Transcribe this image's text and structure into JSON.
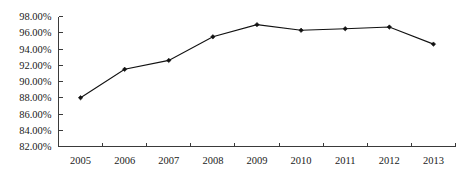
{
  "chart_data": {
    "type": "line",
    "title": "",
    "subtitle": "",
    "xlabel": "",
    "ylabel": "",
    "categories": [
      "2005",
      "2006",
      "2007",
      "2008",
      "2009",
      "2010",
      "2011",
      "2012",
      "2013"
    ],
    "values": [
      88.0,
      91.5,
      92.6,
      95.5,
      97.0,
      96.3,
      96.5,
      96.7,
      94.6
    ],
    "series": [
      {
        "name": "",
        "values": [
          88.0,
          91.5,
          92.6,
          95.5,
          97.0,
          96.3,
          96.5,
          96.7,
          94.6
        ]
      }
    ],
    "ylim": [
      82.0,
      98.0
    ],
    "ytick_values": [
      82.0,
      84.0,
      86.0,
      88.0,
      90.0,
      92.0,
      94.0,
      96.0,
      98.0
    ],
    "ytick_labels": [
      "82.00%",
      "84.00%",
      "86.00%",
      "88.00%",
      "90.00%",
      "92.00%",
      "94.00%",
      "96.00%",
      "98.00%"
    ],
    "xtick_labels": [
      "2005",
      "2006",
      "2007",
      "2008",
      "2009",
      "2010",
      "2011",
      "2012",
      "2013"
    ],
    "grid": false,
    "legend": false,
    "legend_position": "none",
    "marker": "diamond",
    "line_color": "#111111",
    "marker_color": "#111111",
    "axis_color": "#3a3a3a",
    "background_color": "#ffffff",
    "value_format": "percent-2dp"
  }
}
